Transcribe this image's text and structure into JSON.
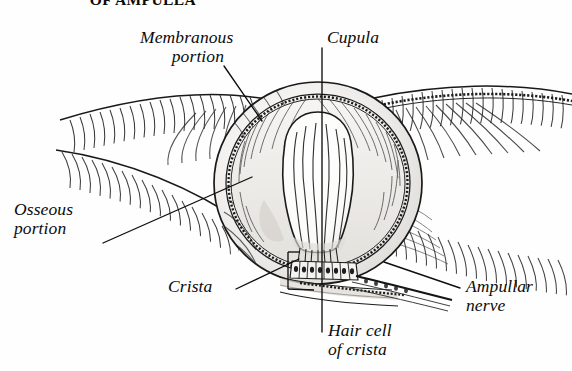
{
  "figure": {
    "title": "OF AMPULLA",
    "title_note": "clipped at top edge of screenshot",
    "background_color": "#fefefe",
    "ink_color": "#141414"
  },
  "labels": {
    "membranous_portion": "Membranous\nportion",
    "membranous_line1": "Membranous",
    "membranous_line2": "portion",
    "cupula": "Cupula",
    "osseous_line1": "Osseous",
    "osseous_line2": "portion",
    "crista": "Crista",
    "ampullar_line1": "Ampullar",
    "ampullar_line2": "nerve",
    "hair_line1": "Hair cell",
    "hair_line2": "of crista"
  },
  "leaders": [
    {
      "name": "membranous-leader",
      "from": [
        224,
        66
      ],
      "to": [
        262,
        121
      ]
    },
    {
      "name": "cupula-leader",
      "from": [
        322,
        48
      ],
      "to": [
        322,
        332
      ]
    },
    {
      "name": "osseous-leader",
      "from": [
        103,
        243
      ],
      "to": [
        252,
        177
      ]
    },
    {
      "name": "crista-leader",
      "from": [
        236,
        289
      ],
      "to": [
        299,
        259
      ]
    },
    {
      "name": "ampullar-leader",
      "from": [
        460,
        288
      ],
      "to": [
        384,
        262
      ]
    }
  ]
}
